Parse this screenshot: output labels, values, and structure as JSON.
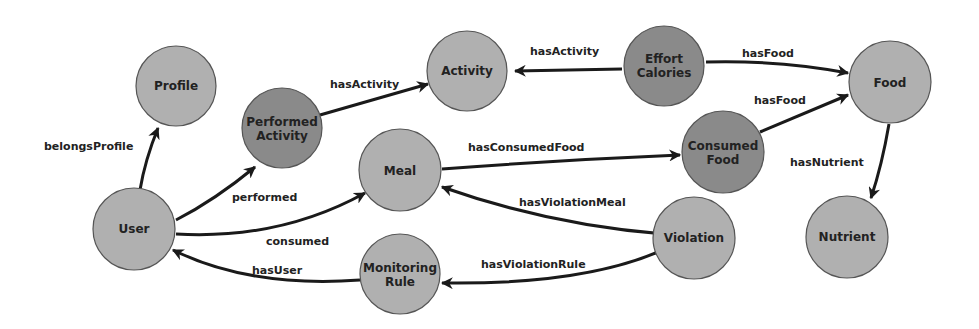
{
  "colors": {
    "light_node": "#b0b0b0",
    "dark_node": "#8a8a8a",
    "edge": "#1a1a1a",
    "background": "#ffffff"
  },
  "nodes": {
    "profile": {
      "line1": "Profile",
      "line2": ""
    },
    "user": {
      "line1": "User",
      "line2": ""
    },
    "performed_activity": {
      "line1": "Performed",
      "line2": "Activity"
    },
    "activity": {
      "line1": "Activity",
      "line2": ""
    },
    "effort_calories": {
      "line1": "Effort",
      "line2": "Calories"
    },
    "food": {
      "line1": "Food",
      "line2": ""
    },
    "meal": {
      "line1": "Meal",
      "line2": ""
    },
    "consumed_food": {
      "line1": "Consumed",
      "line2": "Food"
    },
    "violation": {
      "line1": "Violation",
      "line2": ""
    },
    "nutrient": {
      "line1": "Nutrient",
      "line2": ""
    },
    "monitoring_rule": {
      "line1": "Monitoring",
      "line2": "Rule"
    }
  },
  "edges": {
    "belongs_profile": "belongsProfile",
    "performed": "performed",
    "consumed": "consumed",
    "has_user": "hasUser",
    "has_activity_1": "hasActivity",
    "has_activity_2": "hasActivity",
    "has_food_1": "hasFood",
    "has_food_2": "hasFood",
    "has_consumed_food": "hasConsumedFood",
    "has_violation_meal": "hasViolationMeal",
    "has_violation_rule": "hasViolationRule",
    "has_nutrient": "hasNutrient"
  }
}
